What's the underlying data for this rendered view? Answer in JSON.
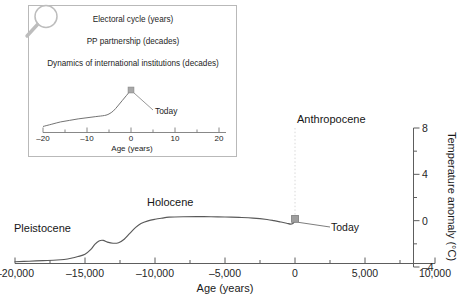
{
  "chart_data": {
    "type": "line",
    "title": "",
    "xlabel": "Age (years)",
    "ylabel": "Temperature anomaly (°C)",
    "xlim": [
      -20000,
      10000
    ],
    "ylim": [
      -4,
      8
    ],
    "xticks": [
      -20000,
      -15000,
      -10000,
      -5000,
      0,
      5000,
      10000
    ],
    "xticklabels": [
      "–20,000",
      "–15,000",
      "–10,000",
      "–5,000",
      "0",
      "5,000",
      "10,000"
    ],
    "yticks": [
      -4,
      0,
      4,
      8
    ],
    "yticklabels": [
      "–4",
      "0",
      "4",
      "8"
    ],
    "yminorticks": [
      -2,
      2,
      6
    ],
    "grid": false,
    "legend": "none",
    "yaxis_position": "right",
    "series": [
      {
        "name": "Temperature anomaly",
        "color": "#595959",
        "x": [
          -20000,
          -19000,
          -18000,
          -17000,
          -16500,
          -16000,
          -15500,
          -15000,
          -14600,
          -14300,
          -14000,
          -13700,
          -13400,
          -13000,
          -12600,
          -12200,
          -11800,
          -11400,
          -11000,
          -10500,
          -10000,
          -9500,
          -9000,
          -8000,
          -7000,
          -6000,
          -5000,
          -4000,
          -3000,
          -2000,
          -1500,
          -1000,
          -600,
          -300,
          -100,
          0
        ],
        "y": [
          -3.55,
          -3.5,
          -3.45,
          -3.4,
          -3.35,
          -3.25,
          -3.1,
          -2.9,
          -2.5,
          -2.05,
          -1.75,
          -1.7,
          -1.85,
          -1.95,
          -1.9,
          -1.6,
          -1.1,
          -0.6,
          -0.25,
          -0.02,
          0.12,
          0.22,
          0.3,
          0.34,
          0.35,
          0.34,
          0.32,
          0.28,
          0.22,
          0.1,
          0.0,
          -0.12,
          -0.22,
          -0.3,
          -0.2,
          0.15
        ]
      }
    ],
    "markers": [
      {
        "name": "today-marker",
        "x": 0,
        "y": 0.15,
        "label": "Today",
        "shape": "square",
        "color": "#8c8c8c"
      }
    ],
    "annotations": [
      {
        "name": "pleistocene-label",
        "text": "Pleistocene"
      },
      {
        "name": "holocene-label",
        "text": "Holocene"
      },
      {
        "name": "anthropocene-label",
        "text": "Anthropocene"
      },
      {
        "name": "today-label",
        "text": "Today"
      }
    ],
    "vertical_marker": {
      "x": 0,
      "style": "dotted",
      "color": "#d8d8d8"
    }
  },
  "inset": {
    "icon": "magnifier-icon",
    "lines": [
      "Electoral cycle (years)",
      "PP partnership (decades)",
      "Dynamics of international institutions (decades)"
    ],
    "today_label": "Today",
    "chart_data": {
      "type": "line",
      "xlabel": "Age (years)",
      "xlim": [
        -20,
        20
      ],
      "xticks": [
        -20,
        -10,
        0,
        10,
        20
      ],
      "xticklabels": [
        "–20",
        "–10",
        "0",
        "10",
        "20"
      ],
      "grid": false,
      "legend": "none",
      "series": [
        {
          "name": "Recent anomaly",
          "color": "#6b6b6b",
          "x": [
            -20,
            -18,
            -16,
            -14,
            -12,
            -10,
            -8,
            -6,
            -5,
            -4,
            -3,
            -2,
            -1,
            0
          ],
          "y": [
            0.04,
            0.1,
            0.16,
            0.2,
            0.24,
            0.27,
            0.3,
            0.33,
            0.37,
            0.45,
            0.58,
            0.72,
            0.86,
            1.0
          ]
        }
      ],
      "markers": [
        {
          "name": "today-marker",
          "x": 0,
          "y": 1.0,
          "shape": "square",
          "color": "#9a9a9a"
        }
      ]
    }
  },
  "colors": {
    "axis": "#5d5d5d",
    "curve": "#595959",
    "marker": "#8c8c8c",
    "inset_border": "#b9b9b9",
    "text": "#1a1a1a"
  }
}
